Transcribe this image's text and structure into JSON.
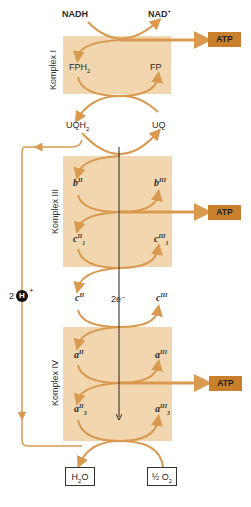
{
  "diagram": {
    "colors": {
      "complex_fill": "#f2d6b0",
      "arrow": "#d99a50",
      "atp_fill": "#c8802c",
      "electron_line": "#222222"
    },
    "top": {
      "nadh": "NADH",
      "nad": "NAD",
      "nad_sup": "+"
    },
    "complex1": {
      "label": "Komplex I",
      "left": "FPH",
      "left_sub": "2",
      "right": "FP"
    },
    "uq": {
      "left": "UQH",
      "left_sub": "2",
      "right": "UQ"
    },
    "complex3": {
      "label": "Komplex III",
      "b_left": "b",
      "b_left_sup": "II",
      "b_right": "b",
      "b_right_sup": "III",
      "c1_left": "c",
      "c1_left_sup": "II",
      "c1_left_sub": "1",
      "c1_right": "c",
      "c1_right_sup": "III",
      "c1_right_sub": "1"
    },
    "cytc": {
      "left": "c",
      "left_sup": "II",
      "center": "2e⁻",
      "right": "c",
      "right_sup": "III"
    },
    "complex4": {
      "label": "Komplex IV",
      "a_left": "a",
      "a_left_sup": "II",
      "a_right": "a",
      "a_right_sup": "III",
      "a3_left": "a",
      "a3_left_sup": "II",
      "a3_left_sub": "3",
      "a3_right": "a",
      "a3_right_sup": "III",
      "a3_right_sub": "3"
    },
    "atp": [
      "ATP",
      "ATP",
      "ATP"
    ],
    "proton": {
      "count": "2",
      "symbol": "H",
      "charge": "+"
    },
    "products": {
      "water": "H",
      "water_sub": "2",
      "water_o": "O",
      "oxygen_frac": "½",
      "oxygen": "O",
      "oxygen_sub": "2"
    }
  }
}
